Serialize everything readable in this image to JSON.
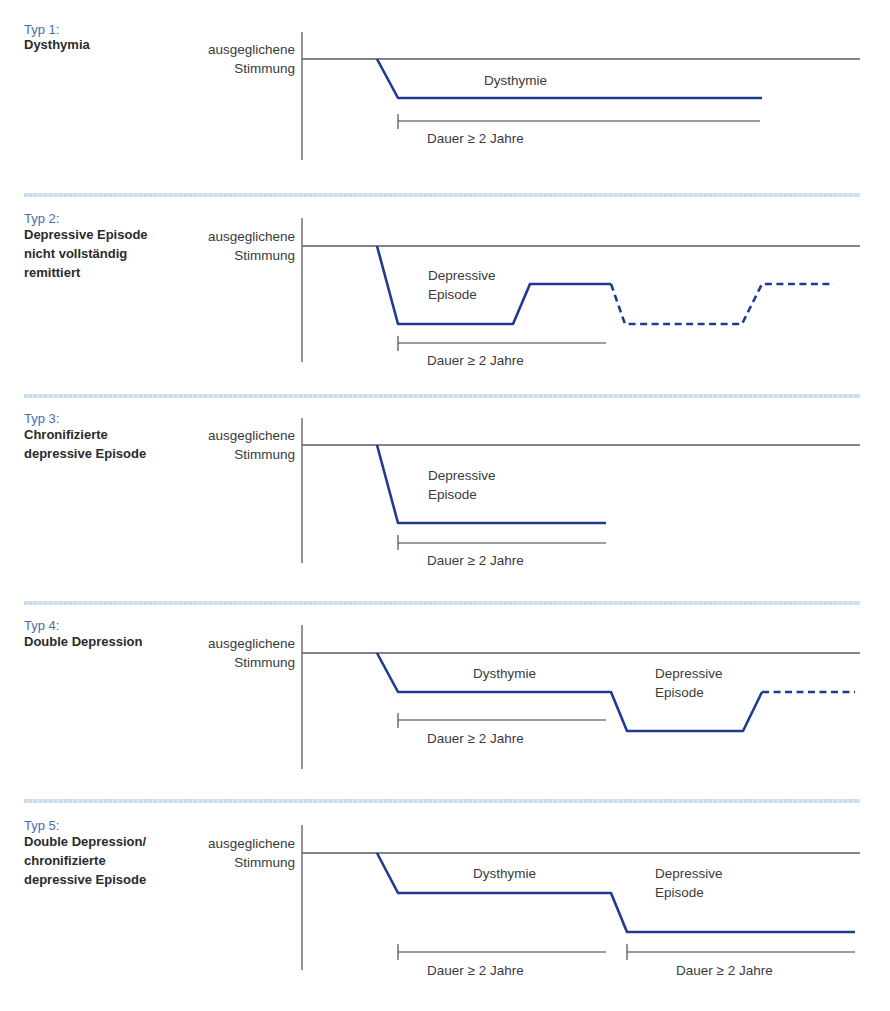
{
  "common": {
    "mood_label": "ausgeglichene\nStimmung",
    "duration_label": "Dauer ≥ 2 Jahre",
    "line_color": "#1f3a93",
    "axis_color": "#555555",
    "typ_color": "#4a6bb0",
    "separator_color": "#c7dcef"
  },
  "panels": [
    {
      "typ": "Typ 1:",
      "title": "Dysthymia",
      "labels": [
        {
          "text": "Dysthymie"
        }
      ],
      "durations": [
        "Dauer ≥ 2 Jahre"
      ]
    },
    {
      "typ": "Typ 2:",
      "title": "Depressive Episode\nnicht vollständig\nremittiert",
      "labels": [
        {
          "text": "Depressive\nEpisode"
        }
      ],
      "durations": [
        "Dauer ≥ 2 Jahre"
      ]
    },
    {
      "typ": "Typ 3:",
      "title": "Chronifizierte\ndepressive Episode",
      "labels": [
        {
          "text": "Depressive\nEpisode"
        }
      ],
      "durations": [
        "Dauer ≥ 2 Jahre"
      ]
    },
    {
      "typ": "Typ 4:",
      "title": "Double Depression",
      "labels": [
        {
          "text": "Dysthymie"
        },
        {
          "text": "Depressive\nEpisode"
        }
      ],
      "durations": [
        "Dauer ≥ 2 Jahre"
      ]
    },
    {
      "typ": "Typ 5:",
      "title": "Double Depression/\nchronifizierte\ndepressive Episode",
      "labels": [
        {
          "text": "Dysthymie"
        },
        {
          "text": "Depressive\nEpisode"
        }
      ],
      "durations": [
        "Dauer ≥ 2 Jahre",
        "Dauer ≥ 2 Jahre"
      ]
    }
  ]
}
